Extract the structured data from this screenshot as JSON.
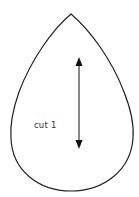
{
  "pattern_piece": {
    "shape": "teardrop",
    "outline_color": "#222222",
    "fill_color": "#ffffff",
    "label": "cut 1",
    "grainline": {
      "type": "double-headed-arrow",
      "orientation": "vertical",
      "color": "#111111"
    }
  }
}
